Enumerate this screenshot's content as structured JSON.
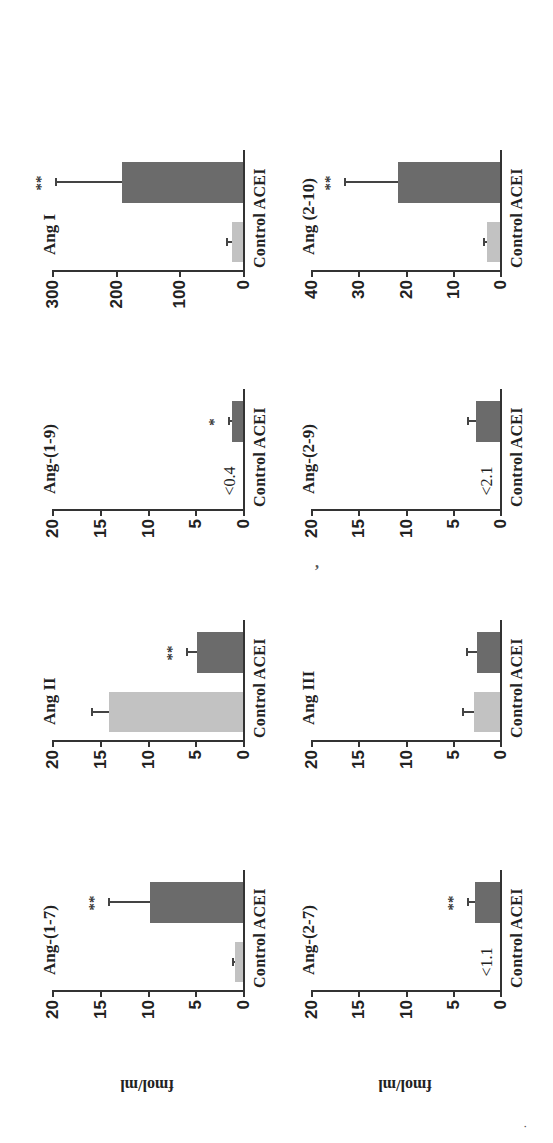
{
  "figure": {
    "orientation": "rotated 90deg counter-clockwise",
    "y_label": "fmol/ml",
    "categories": [
      "Control",
      "ACEI"
    ],
    "category_label": "Control ACEI",
    "colors": {
      "control": "#c2c2c2",
      "acei": "#6b6b6b",
      "axis": "#333333"
    }
  },
  "chart_data": [
    {
      "type": "bar",
      "title": "Ang-(1-7)",
      "categories": [
        "Control",
        "ACEI"
      ],
      "values": [
        0.8,
        9.7
      ],
      "errors": [
        0.4,
        4.4
      ],
      "significance": [
        "",
        "**"
      ],
      "ylabel": "fmol/ml",
      "ylim": [
        0,
        20
      ],
      "yticks": [
        0,
        5,
        10,
        15,
        20
      ]
    },
    {
      "type": "bar",
      "title": "Ang II",
      "categories": [
        "Control",
        "ACEI"
      ],
      "values": [
        14.0,
        4.8
      ],
      "errors": [
        1.9,
        1.2
      ],
      "significance": [
        "",
        "**"
      ],
      "ylabel": "",
      "ylim": [
        0,
        20
      ],
      "yticks": [
        0,
        5,
        10,
        15,
        20
      ]
    },
    {
      "type": "bar",
      "title": "Ang-(1-9)",
      "categories": [
        "Control",
        "ACEI"
      ],
      "values": [
        null,
        1.2
      ],
      "errors": [
        null,
        0.4
      ],
      "control_note": "<0.4",
      "significance": [
        "",
        "*"
      ],
      "ylabel": "",
      "ylim": [
        0,
        20
      ],
      "yticks": [
        0,
        5,
        10,
        15,
        20
      ]
    },
    {
      "type": "bar",
      "title": "Ang I",
      "categories": [
        "Control",
        "ACEI"
      ],
      "values": [
        18,
        190
      ],
      "errors": [
        8,
        105
      ],
      "significance": [
        "",
        "**"
      ],
      "ylabel": "",
      "ylim": [
        0,
        300
      ],
      "yticks": [
        0,
        100,
        200,
        300
      ]
    },
    {
      "type": "bar",
      "title": "Ang-(2-7)",
      "categories": [
        "Control",
        "ACEI"
      ],
      "values": [
        null,
        2.6
      ],
      "errors": [
        null,
        0.9
      ],
      "control_note": "<1.1",
      "significance": [
        "",
        "**"
      ],
      "ylabel": "fmol/ml",
      "ylim": [
        0,
        20
      ],
      "yticks": [
        0,
        5,
        10,
        15,
        20
      ]
    },
    {
      "type": "bar",
      "title": "Ang III",
      "categories": [
        "Control",
        "ACEI"
      ],
      "values": [
        2.8,
        2.4
      ],
      "errors": [
        1.2,
        1.2
      ],
      "significance": [
        "",
        ""
      ],
      "ylabel": "",
      "ylim": [
        0,
        20
      ],
      "yticks": [
        0,
        5,
        10,
        15,
        20
      ]
    },
    {
      "type": "bar",
      "title": "Ang-(2-9)",
      "categories": [
        "Control",
        "ACEI"
      ],
      "values": [
        null,
        2.5
      ],
      "errors": [
        null,
        1.0
      ],
      "control_note": "<2.1",
      "significance": [
        "",
        ""
      ],
      "ylabel": "",
      "ylim": [
        0,
        20
      ],
      "yticks": [
        0,
        5,
        10,
        15,
        20
      ]
    },
    {
      "type": "bar",
      "title": "Ang (2-10)",
      "categories": [
        "Control",
        "ACEI"
      ],
      "values": [
        2.7,
        21.5
      ],
      "errors": [
        0.9,
        11.5
      ],
      "significance": [
        "",
        "**"
      ],
      "ylabel": "",
      "ylim": [
        0,
        40
      ],
      "yticks": [
        0,
        10,
        20,
        30,
        40
      ]
    }
  ],
  "panels": [
    {
      "title": "Ang-(1-7)",
      "ticks": [
        "20",
        "15",
        "10",
        "5",
        "0"
      ],
      "sig": "**",
      "lod": ""
    },
    {
      "title": "Ang II",
      "ticks": [
        "20",
        "15",
        "10",
        "5",
        "0"
      ],
      "sig": "**",
      "lod": ""
    },
    {
      "title": "Ang-(1-9)",
      "ticks": [
        "20",
        "15",
        "10",
        "5",
        "0"
      ],
      "sig": "*",
      "lod": "<0.4"
    },
    {
      "title": "Ang I",
      "ticks": [
        "300",
        "200",
        "100",
        "0"
      ],
      "sig": "**",
      "lod": ""
    },
    {
      "title": "Ang-(2-7)",
      "ticks": [
        "20",
        "15",
        "10",
        "5",
        "0"
      ],
      "sig": "**",
      "lod": "<1.1"
    },
    {
      "title": "Ang III",
      "ticks": [
        "20",
        "15",
        "10",
        "5",
        "0"
      ],
      "sig": "",
      "lod": ""
    },
    {
      "title": "Ang-(2-9)",
      "ticks": [
        "20",
        "15",
        "10",
        "5",
        "0"
      ],
      "sig": "",
      "lod": "<2.1"
    },
    {
      "title": "Ang (2-10)",
      "ticks": [
        "40",
        "30",
        "20",
        "10",
        "0"
      ],
      "sig": "**",
      "lod": ""
    }
  ],
  "marks": {
    "comma": ",",
    "dot": "."
  }
}
